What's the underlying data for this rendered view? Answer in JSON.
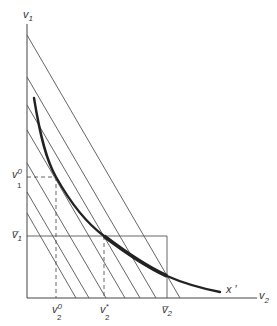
{
  "diagram": {
    "type": "isoquant-with-budget-lines",
    "colors": {
      "stroke": "#444444",
      "curve": "#222222",
      "text": "#333333",
      "background": "#ffffff"
    },
    "axes": {
      "y": {
        "symbol": "v",
        "subscript": "1"
      },
      "x": {
        "symbol": "v",
        "subscript": "2"
      }
    },
    "curve_label": "x ′",
    "markers": {
      "v1_zero": {
        "symbol": "v",
        "sup": "0",
        "sub": "1"
      },
      "v1_bar": {
        "symbol": "v̅",
        "sub": "1"
      },
      "v2_zero": {
        "symbol": "v",
        "sup": "0",
        "sub": "2"
      },
      "v2_star": {
        "symbol": "v",
        "sup": "*",
        "sub": "2"
      },
      "v2_bar": {
        "symbol": "v̅",
        "sub": "2"
      }
    },
    "parallel_lines_count": 7
  }
}
